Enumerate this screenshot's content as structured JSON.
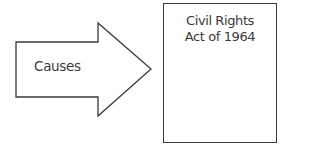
{
  "diagram": {
    "arrow": {
      "label": "Causes",
      "direction": "right",
      "stroke": "#3a3a3a"
    },
    "box": {
      "title_line1": "Civil Rights",
      "title_line2": "Act of 1964",
      "stroke": "#3a3a3a"
    }
  }
}
